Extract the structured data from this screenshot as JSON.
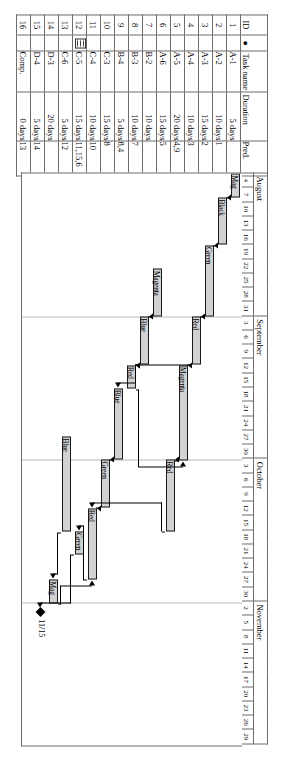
{
  "chart_data": {
    "type": "bar",
    "xlabel": "",
    "ylabel": "",
    "axis_months": [
      {
        "label": "August",
        "span": 10
      },
      {
        "label": "September",
        "span": 10
      },
      {
        "label": "October",
        "span": 10
      },
      {
        "label": "November",
        "span": 10
      }
    ],
    "axis_ticks": [
      "4",
      "7",
      "10",
      "13",
      "16",
      "19",
      "22",
      "25",
      "28",
      "31",
      "3",
      "6",
      "9",
      "12",
      "15",
      "18",
      "21",
      "24",
      "27",
      "30",
      "3",
      "6",
      "9",
      "12",
      "15",
      "18",
      "21",
      "24",
      "27",
      "30",
      "2",
      "5",
      "8",
      "11",
      "14",
      "17",
      "20",
      "23",
      "26",
      "29"
    ],
    "milestone": {
      "label": "11/15",
      "marker": "diamond"
    },
    "categories": [
      "A-1",
      "A-2",
      "A-3",
      "A-4",
      "A-5",
      "A-6",
      "B-2",
      "B-3",
      "B-4",
      "C-3",
      "C-4",
      "C-5",
      "C-6",
      "D-3",
      "D-4",
      "Comp."
    ],
    "values": [
      5,
      10,
      15,
      10,
      20,
      15,
      10,
      10,
      5,
      15,
      10,
      15,
      5,
      20,
      5,
      0
    ],
    "bars": [
      {
        "id": 1,
        "label": "Mag",
        "start_unit": 0.0,
        "length_units": 1.67
      },
      {
        "id": 2,
        "label": "Black",
        "start_unit": 1.67,
        "length_units": 3.33
      },
      {
        "id": 3,
        "label": "Green",
        "start_unit": 5.0,
        "length_units": 5.0
      },
      {
        "id": 4,
        "label": "Red",
        "start_unit": 10.0,
        "length_units": 3.33
      },
      {
        "id": 5,
        "label": "Magenta",
        "start_unit": 13.4,
        "length_units": 6.67
      },
      {
        "id": 6,
        "label": "Red",
        "start_unit": 20.0,
        "length_units": 5.0
      },
      {
        "id": 7,
        "label": "Magenta",
        "start_unit": 6.67,
        "length_units": 3.33
      },
      {
        "id": 8,
        "label": "Blue",
        "start_unit": 10.0,
        "length_units": 3.33
      },
      {
        "id": 9,
        "label": "Red",
        "start_unit": 13.4,
        "length_units": 1.67
      },
      {
        "id": 10,
        "label": "Blue",
        "start_unit": 15.0,
        "length_units": 5.0
      },
      {
        "id": 11,
        "label": "Green",
        "start_unit": 20.0,
        "length_units": 3.33
      },
      {
        "id": 12,
        "label": "Red",
        "start_unit": 23.4,
        "length_units": 5.0
      },
      {
        "id": 13,
        "label": "Green",
        "start_unit": 25.0,
        "length_units": 1.67
      },
      {
        "id": 14,
        "label": "Blue",
        "start_unit": 18.4,
        "length_units": 6.67
      },
      {
        "id": 15,
        "label": "Mag",
        "start_unit": 28.4,
        "length_units": 1.67
      },
      {
        "id": 16,
        "label": "",
        "start_unit": 30.4,
        "length_units": 0
      }
    ]
  },
  "table": {
    "headers": {
      "id": "ID",
      "indicator": "●",
      "task_name": "Task name",
      "duration": "Duration",
      "pred": "Pred."
    },
    "rows": [
      {
        "id": "1",
        "name": "A-1",
        "duration": "5 days",
        "pred": ""
      },
      {
        "id": "2",
        "name": "A-2",
        "duration": "10 days",
        "pred": "1"
      },
      {
        "id": "3",
        "name": "A-3",
        "duration": "15 days",
        "pred": "2"
      },
      {
        "id": "4",
        "name": "A-4",
        "duration": "10 days",
        "pred": "3"
      },
      {
        "id": "5",
        "name": "A-5",
        "duration": "20 days",
        "pred": "4,9"
      },
      {
        "id": "6",
        "name": "A-6",
        "duration": "15 days",
        "pred": "5"
      },
      {
        "id": "7",
        "name": "B-2",
        "duration": "10 days",
        "pred": ""
      },
      {
        "id": "8",
        "name": "B-3",
        "duration": "10 days",
        "pred": "7"
      },
      {
        "id": "9",
        "name": "B-4",
        "duration": "5 days",
        "pred": "8,4"
      },
      {
        "id": "10",
        "name": "C-3",
        "duration": "15 days",
        "pred": "8"
      },
      {
        "id": "11",
        "name": "C-4",
        "duration": "10 days",
        "pred": "10"
      },
      {
        "id": "12",
        "name": "C-5",
        "duration": "15 days",
        "pred": "11,15,6"
      },
      {
        "id": "13",
        "name": "C-6",
        "duration": "5 days",
        "pred": "12"
      },
      {
        "id": "14",
        "name": "D-3",
        "duration": "20 days",
        "pred": ""
      },
      {
        "id": "15",
        "name": "D-4",
        "duration": "5 days",
        "pred": "14"
      },
      {
        "id": "16",
        "name": "Comp.",
        "duration": "0 days",
        "pred": "13"
      }
    ],
    "indicator_rows": [
      "12"
    ]
  }
}
